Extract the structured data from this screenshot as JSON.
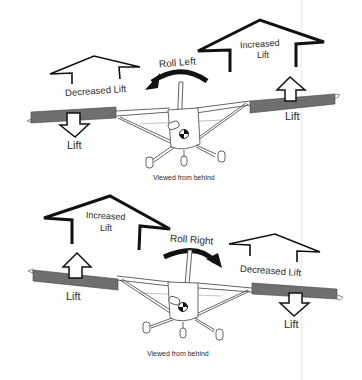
{
  "diagram": {
    "colors": {
      "wing_aileron": "#6f6f6f",
      "outline": "#111111",
      "line": "#555555"
    },
    "panels": [
      {
        "id": "roll-left",
        "roll_label": "Roll Left",
        "left_wing": {
          "big_arrow_label": "Decreased Lift",
          "small_arrow_label": "Lift",
          "small_arrow_direction": "down"
        },
        "right_wing": {
          "big_arrow_label_line1": "Increased",
          "big_arrow_label_line2": "Lift",
          "small_arrow_label": "Lift",
          "small_arrow_direction": "up"
        },
        "caption": "Viewed from behind"
      },
      {
        "id": "roll-right",
        "roll_label": "Roll Right",
        "left_wing": {
          "big_arrow_label_line1": "Increased",
          "big_arrow_label_line2": "Lift",
          "small_arrow_label": "Lift",
          "small_arrow_direction": "up"
        },
        "right_wing": {
          "big_arrow_label": "Decreased Lift",
          "small_arrow_label": "Lift",
          "small_arrow_direction": "down"
        },
        "caption": "Viewed from behind"
      }
    ]
  }
}
